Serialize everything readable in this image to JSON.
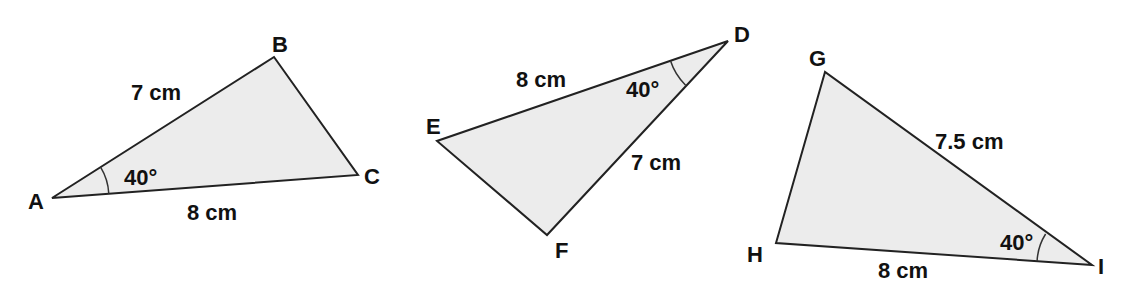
{
  "colors": {
    "fill": "#ececec",
    "stroke": "#222222",
    "text": "#111111",
    "background": "#ffffff"
  },
  "triangles": [
    {
      "name": "ABC",
      "vertices": [
        {
          "label": "A",
          "x": 52,
          "y": 198
        },
        {
          "label": "B",
          "x": 274,
          "y": 57
        },
        {
          "label": "C",
          "x": 358,
          "y": 175
        }
      ],
      "sides": [
        {
          "between": "AB",
          "label": "7 cm"
        },
        {
          "between": "AC",
          "label": "8 cm"
        }
      ],
      "angle": {
        "at": "A",
        "label": "40°"
      }
    },
    {
      "name": "DEF",
      "vertices": [
        {
          "label": "D",
          "x": 728,
          "y": 41
        },
        {
          "label": "E",
          "x": 437,
          "y": 141
        },
        {
          "label": "F",
          "x": 547,
          "y": 235
        }
      ],
      "sides": [
        {
          "between": "DE",
          "label": "8 cm"
        },
        {
          "between": "DF",
          "label": "7 cm"
        }
      ],
      "angle": {
        "at": "D",
        "label": "40°"
      }
    },
    {
      "name": "GHI",
      "vertices": [
        {
          "label": "G",
          "x": 825,
          "y": 72
        },
        {
          "label": "H",
          "x": 776,
          "y": 243
        },
        {
          "label": "I",
          "x": 1092,
          "y": 265
        }
      ],
      "sides": [
        {
          "between": "GI",
          "label": "7.5 cm"
        },
        {
          "between": "HI",
          "label": "8 cm"
        }
      ],
      "angle": {
        "at": "I",
        "label": "40°"
      }
    }
  ]
}
